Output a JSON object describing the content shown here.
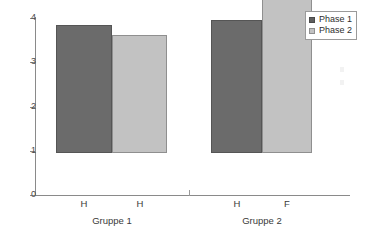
{
  "chart_data": {
    "type": "bar",
    "title": "",
    "subtitle": "",
    "xlabel": "",
    "ylabel": "",
    "ylim": [
      0,
      4
    ],
    "y_ticks": [
      "0",
      "1",
      "2",
      "3",
      "4"
    ],
    "grid": false,
    "legend_position": "top-right",
    "groups": [
      "Gruppe 1",
      "Gruppe 2"
    ],
    "categories": [
      "H",
      "H",
      "H",
      "F"
    ],
    "series": [
      {
        "name": "Phase 1",
        "color": "#6b6b6b",
        "values": [
          2.9,
          null,
          3.0,
          null
        ]
      },
      {
        "name": "Phase 2",
        "color": "#c2c2c2",
        "values": [
          null,
          2.67,
          null,
          3.65
        ]
      }
    ],
    "bars": [
      {
        "group": "Gruppe 1",
        "category": "H",
        "series": "Phase 1",
        "value": 2.9
      },
      {
        "group": "Gruppe 1",
        "category": "H",
        "series": "Phase 2",
        "value": 2.67
      },
      {
        "group": "Gruppe 2",
        "category": "H",
        "series": "Phase 1",
        "value": 3.0
      },
      {
        "group": "Gruppe 2",
        "category": "F",
        "series": "Phase 2",
        "value": 3.65
      }
    ]
  },
  "axis": {
    "y": {
      "ticks": [
        {
          "label": "4",
          "value": 4
        },
        {
          "label": "3",
          "value": 3
        },
        {
          "label": "2",
          "value": 2
        },
        {
          "label": "1",
          "value": 1
        },
        {
          "label": "0",
          "value": 0
        }
      ]
    },
    "x": {
      "tick_labels": [
        "H",
        "H",
        "H",
        "F"
      ],
      "group_labels": [
        "Gruppe 1",
        "Gruppe 2"
      ]
    }
  },
  "legend": {
    "items": [
      {
        "label": "Phase 1",
        "color": "#6b6b6b"
      },
      {
        "label": "Phase 2",
        "color": "#c2c2c2"
      }
    ]
  },
  "colors": {
    "phase1": "#6b6b6b",
    "phase2": "#c2c2c2",
    "axis": "#8a8a8a",
    "background": "#ffffff"
  }
}
